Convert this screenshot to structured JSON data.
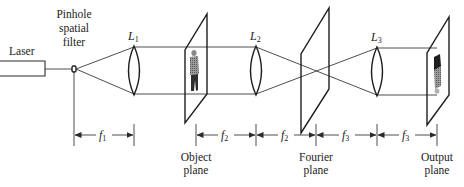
{
  "diagram": {
    "components": {
      "laser": {
        "label": "Laser"
      },
      "pinhole": {
        "label_lines": [
          "Pinhole",
          "spatial",
          "filter"
        ]
      },
      "lenses": [
        {
          "name": "L",
          "sub": "1"
        },
        {
          "name": "L",
          "sub": "2"
        },
        {
          "name": "L",
          "sub": "3"
        }
      ],
      "planes": [
        {
          "label_lines": [
            "Object",
            "plane"
          ]
        },
        {
          "label_lines": [
            "Fourier",
            "plane"
          ]
        },
        {
          "label_lines": [
            "Output",
            "plane"
          ]
        }
      ]
    },
    "dimensions": [
      {
        "name": "f",
        "sub": "1"
      },
      {
        "name": "f",
        "sub": "2"
      },
      {
        "name": "f",
        "sub": "2"
      },
      {
        "name": "f",
        "sub": "3"
      },
      {
        "name": "f",
        "sub": "3"
      }
    ],
    "colors": {
      "line": "#2a2a2a",
      "background": "#ffffff",
      "object_image": "#555555"
    }
  }
}
